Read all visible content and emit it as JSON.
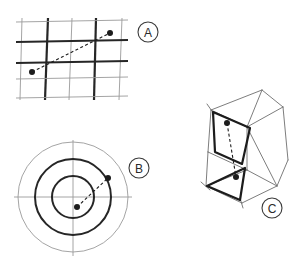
{
  "figure": {
    "background_color": "#ffffff",
    "ink_color": "#1c1c1c",
    "light_ink_color": "#8d8d8d",
    "width": 301,
    "height": 261
  },
  "panels": [
    {
      "id": "A",
      "label": "A",
      "name": "panel-a-grid",
      "description": "rectilinear grid with alternating thick and thin lines, two marked points joined by a dashed line",
      "label_position": {
        "x": 148,
        "y": 32
      },
      "label_radius": 10,
      "grid": {
        "thick_line_color": "#262626",
        "thin_line_color": "#9a9a9a",
        "thick_line_width": 2.2,
        "thin_line_width": 0.9,
        "vertical_lines": [
          {
            "x_top": 22,
            "x_bottom": 20,
            "weight": "thin"
          },
          {
            "x_top": 48,
            "x_bottom": 45,
            "weight": "thick"
          },
          {
            "x_top": 72,
            "x_bottom": 69,
            "weight": "thin"
          },
          {
            "x_top": 96,
            "x_bottom": 94,
            "weight": "thick"
          },
          {
            "x_top": 122,
            "x_bottom": 119,
            "weight": "thin"
          }
        ],
        "horizontal_lines": [
          {
            "y_left": 22,
            "y_right": 20,
            "weight": "thin"
          },
          {
            "y_left": 42,
            "y_right": 40,
            "weight": "thick"
          },
          {
            "y_left": 63,
            "y_right": 61,
            "weight": "thick"
          },
          {
            "y_left": 79,
            "y_right": 77,
            "weight": "thin"
          },
          {
            "y_left": 98,
            "y_right": 96,
            "weight": "thin"
          }
        ]
      },
      "points": [
        {
          "name": "point-start",
          "x": 32,
          "y": 72,
          "r": 3.0
        },
        {
          "name": "point-end",
          "x": 110,
          "y": 33,
          "r": 3.0
        }
      ],
      "connector": {
        "name": "dashed-connector",
        "x1": 32,
        "y1": 72,
        "x2": 110,
        "y2": 33,
        "dash": "3,2.4",
        "width": 1.1
      }
    },
    {
      "id": "B",
      "label": "B",
      "name": "panel-b-polar",
      "description": "concentric circles (polar grid) with crosshair axes, two marked points joined by a dashed line",
      "label_position": {
        "x": 139,
        "y": 168
      },
      "label_radius": 10,
      "center": {
        "x": 73,
        "y": 197
      },
      "circles": [
        {
          "name": "outer-circle",
          "r": 55,
          "color": "#9a9a9a",
          "width": 0.9
        },
        {
          "name": "middle-circle",
          "r": 38,
          "color": "#262626",
          "width": 2.0
        },
        {
          "name": "inner-circle",
          "r": 21,
          "color": "#262626",
          "width": 2.0
        }
      ],
      "axes": {
        "horizontal": {
          "x1": 14,
          "y1": 197,
          "x2": 132,
          "y2": 197
        },
        "vertical": {
          "x1": 73,
          "y1": 140,
          "x2": 73,
          "y2": 256
        },
        "color": "#9a9a9a",
        "width": 0.9
      },
      "points": [
        {
          "name": "point-start",
          "x": 77,
          "y": 207,
          "r": 3.0
        },
        {
          "name": "point-end",
          "x": 108,
          "y": 178,
          "r": 3.0
        }
      ],
      "connector": {
        "name": "dashed-connector",
        "x1": 77,
        "y1": 207,
        "x2": 108,
        "y2": 178,
        "dash": "3,2.4",
        "width": 1.1
      }
    },
    {
      "id": "C",
      "label": "C",
      "name": "panel-c-polyhedron",
      "description": "wireframe 3D prism-like solid with two emphasised faces, two marked points joined by a dashed line",
      "label_position": {
        "x": 272,
        "y": 208
      },
      "label_radius": 10,
      "wire_color": "#6e6e6e",
      "wire_width": 0.9,
      "emphasis_color": "#1c1c1c",
      "emphasis_width": 2.2,
      "wire_edges": [
        {
          "name": "edge-top-left-ridge",
          "x1": 211,
          "y1": 110,
          "x2": 262,
          "y2": 90
        },
        {
          "name": "edge-top-right-ridge",
          "x1": 262,
          "y1": 90,
          "x2": 283,
          "y2": 107
        },
        {
          "name": "edge-top-front",
          "x1": 211,
          "y1": 110,
          "x2": 247,
          "y2": 127
        },
        {
          "name": "edge-top-crease",
          "x1": 247,
          "y1": 127,
          "x2": 283,
          "y2": 107
        },
        {
          "name": "edge-apex-spur",
          "x1": 262,
          "y1": 90,
          "x2": 247,
          "y2": 127
        },
        {
          "name": "edge-right-back",
          "x1": 283,
          "y1": 107,
          "x2": 288,
          "y2": 160
        },
        {
          "name": "edge-right-front",
          "x1": 288,
          "y1": 160,
          "x2": 277,
          "y2": 186
        },
        {
          "name": "edge-mid-right",
          "x1": 247,
          "y1": 127,
          "x2": 277,
          "y2": 186
        },
        {
          "name": "edge-left-upper",
          "x1": 211,
          "y1": 110,
          "x2": 208,
          "y2": 152
        },
        {
          "name": "edge-left-lower",
          "x1": 208,
          "y1": 152,
          "x2": 206,
          "y2": 186
        },
        {
          "name": "edge-bottom-left",
          "x1": 206,
          "y1": 186,
          "x2": 242,
          "y2": 203
        },
        {
          "name": "edge-bottom-right",
          "x1": 242,
          "y1": 203,
          "x2": 277,
          "y2": 186
        },
        {
          "name": "edge-bottom-crease",
          "x1": 206,
          "y1": 186,
          "x2": 247,
          "y2": 170
        },
        {
          "name": "edge-bottom-crease-right",
          "x1": 247,
          "y1": 170,
          "x2": 277,
          "y2": 186
        },
        {
          "name": "edge-inner-vertical",
          "x1": 247,
          "y1": 127,
          "x2": 247,
          "y2": 170
        },
        {
          "name": "edge-left-diagonal",
          "x1": 208,
          "y1": 152,
          "x2": 247,
          "y2": 170
        },
        {
          "name": "edge-tick-top-left",
          "x1": 207,
          "y1": 104,
          "x2": 214,
          "y2": 114
        },
        {
          "name": "edge-tick-bottom",
          "x1": 240,
          "y1": 198,
          "x2": 243,
          "y2": 208
        },
        {
          "name": "edge-tick-left-bottom",
          "x1": 201,
          "y1": 182,
          "x2": 210,
          "y2": 190
        }
      ],
      "emphasis_faces": [
        {
          "name": "face-upper-quad",
          "points": "213,112 250,128 242,164 215,152"
        },
        {
          "name": "face-lower-tri",
          "points": "207,186 245,168 240,200"
        }
      ],
      "points": [
        {
          "name": "point-start",
          "x": 227,
          "y": 123,
          "r": 3.0
        },
        {
          "name": "point-end",
          "x": 236,
          "y": 177,
          "r": 3.0
        }
      ],
      "connector": {
        "name": "dashed-connector",
        "x1": 227,
        "y1": 123,
        "x2": 236,
        "y2": 177,
        "dash": "3,2.4",
        "width": 1.1
      }
    }
  ]
}
